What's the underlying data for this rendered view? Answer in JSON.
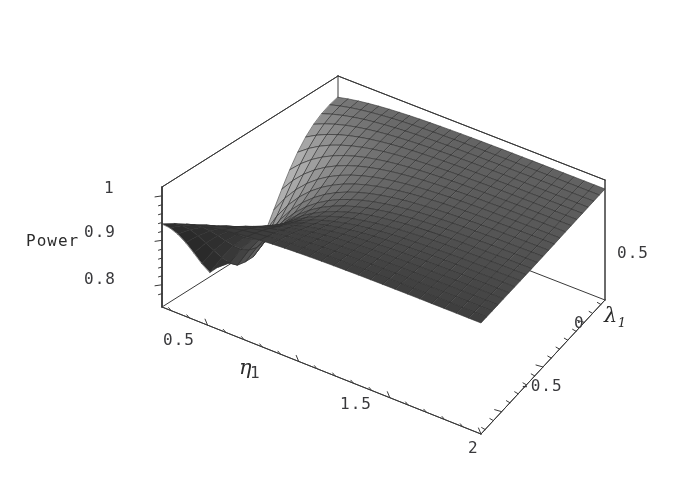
{
  "figure": {
    "kind": "3d-surface-plot",
    "style": "mathematica-plot3d-grayscale",
    "background_color": "#ffffff",
    "line_color": "#3a3a3a",
    "text_color": "#39393c"
  },
  "chart_data": {
    "type": "surface",
    "title": "",
    "xlabel": "η",
    "ylabel": "λ",
    "ylabel_sub": "1",
    "zlabel": "Power",
    "xticks": [
      "0.5",
      "1",
      "1.5",
      "2"
    ],
    "xtickvalues": [
      0.5,
      1,
      1.5,
      2
    ],
    "yticks": [
      "0.5",
      "0",
      "-0.5"
    ],
    "ytickvalues": [
      0.5,
      0,
      -0.5
    ],
    "zticks": [
      "1",
      "0.9",
      "0.8"
    ],
    "ztickvalues": [
      1,
      0.9,
      0.8
    ],
    "xlim": [
      0.25,
      2.0
    ],
    "ylim": [
      -0.75,
      0.75
    ],
    "zlim": [
      0.75,
      1.02
    ],
    "grid": false,
    "mesh": true,
    "mesh_nx": 26,
    "mesh_ny": 22,
    "shading": "grayscale-lightmodel",
    "legend": "none",
    "x": [
      0.25,
      0.32,
      0.39,
      0.46,
      0.53,
      0.6,
      0.67,
      0.74,
      0.81,
      0.88,
      0.95,
      1.02,
      1.09,
      1.16,
      1.23,
      1.3,
      1.37,
      1.44,
      1.51,
      1.58,
      1.65,
      1.72,
      1.79,
      1.86,
      1.93,
      2.0
    ],
    "y": [
      -0.75,
      -0.68,
      -0.61,
      -0.54,
      -0.47,
      -0.4,
      -0.33,
      -0.26,
      -0.19,
      -0.12,
      -0.05,
      0.02,
      0.09,
      0.16,
      0.23,
      0.3,
      0.37,
      0.44,
      0.51,
      0.58,
      0.65,
      0.75
    ],
    "z_note": "Power(eta, lambda1) values in [0.76, 1.00]; surface computed by template from the analytic form described below.",
    "z_model": {
      "form": "power = 1 - A(lambda1) * exp(-k * (eta - eta0))",
      "A_range": [
        0.02,
        0.3
      ],
      "k": 3.1,
      "eta0": 0.25,
      "min_value": 0.76,
      "max_value": 1.0
    },
    "surface_colors": {
      "lightest": "#d9d9d9",
      "light": "#b4b4b4",
      "mid": "#7d7d7d",
      "dark": "#3c3c3c",
      "darkest": "#0d0d0d",
      "mesh_line": "#2f2f2f"
    }
  },
  "axes": {
    "z": {
      "name": "Power",
      "label": "Power",
      "ticks": [
        {
          "label": "1",
          "value": 1.0
        },
        {
          "label": "0.9",
          "value": 0.9
        },
        {
          "label": "0.8",
          "value": 0.8
        }
      ]
    },
    "x": {
      "name": "eta",
      "label": "η",
      "ticks": [
        {
          "label": "0.5",
          "value": 0.5
        },
        {
          "label": "1",
          "value": 1.0
        },
        {
          "label": "1.5",
          "value": 1.5
        },
        {
          "label": "2",
          "value": 2.0
        }
      ]
    },
    "y": {
      "name": "lambda1",
      "label": "λ",
      "label_sub": "1",
      "ticks": [
        {
          "label": "0.5",
          "value": 0.5
        },
        {
          "label": "0",
          "value": 0.0
        },
        {
          "label": "-0.5",
          "value": -0.5
        }
      ]
    }
  }
}
